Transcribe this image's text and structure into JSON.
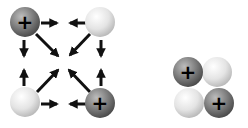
{
  "diagram": {
    "colors": {
      "positive": "#7a7a7a",
      "neutral": "#e6e6e6",
      "arrow": "#111111",
      "background": "#ffffff"
    },
    "left_group": {
      "particles": [
        {
          "id": "tl",
          "charge": "+",
          "cx": 25,
          "cy": 22
        },
        {
          "id": "tr",
          "charge": "",
          "cx": 100,
          "cy": 22
        },
        {
          "id": "bl",
          "charge": "",
          "cx": 25,
          "cy": 102
        },
        {
          "id": "br",
          "charge": "+",
          "cx": 100,
          "cy": 102
        }
      ]
    },
    "right_group": {
      "particles": [
        {
          "id": "tl",
          "charge": "+",
          "cx": 188,
          "cy": 72
        },
        {
          "id": "tr",
          "charge": "",
          "cx": 217,
          "cy": 72
        },
        {
          "id": "bl",
          "charge": "",
          "cx": 189,
          "cy": 103
        },
        {
          "id": "br",
          "charge": "+",
          "cx": 219,
          "cy": 103
        }
      ]
    },
    "labels": {
      "plus": "+"
    }
  }
}
